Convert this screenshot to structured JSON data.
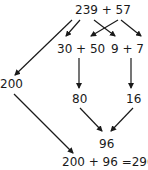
{
  "diagram": {
    "nodes": {
      "root": "239 + 57",
      "tens": "30 + 50",
      "ones": "9 + 7",
      "hundreds": "200",
      "tens_sum": "80",
      "ones_sum": "16",
      "partial": "96",
      "result": "200 + 96 =296"
    },
    "colors": {
      "text": "#1a1a1a",
      "arrow": "#1a1a1a",
      "background": "#ffffff"
    }
  }
}
